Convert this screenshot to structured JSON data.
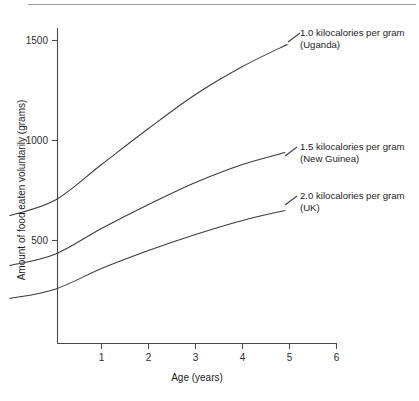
{
  "chart_data": {
    "type": "line",
    "title": "",
    "xlabel": "Age (years)",
    "ylabel": "Amount of food eaten voluntarily (grams)",
    "xlim": [
      -0.95,
      6.0
    ],
    "ylim": [
      0,
      1680
    ],
    "xticks": [
      1,
      2,
      3,
      4,
      5,
      6
    ],
    "xtick_labels": [
      "1",
      "2",
      "3",
      "4",
      "5",
      "6"
    ],
    "yticks": [
      500,
      1000,
      1500
    ],
    "ytick_labels": [
      "500",
      "1000",
      "1500"
    ],
    "grid": false,
    "legend_position": "inline-right-annotations",
    "series": [
      {
        "name": "1.0 kilocalories per gram (Uganda)",
        "label_line1": "1.0 kilocalories per gram",
        "label_line2": "(Uganda)",
        "x": [
          -0.95,
          0.0,
          1.0,
          2.0,
          3.0,
          4.0,
          4.95
        ],
        "values": [
          625,
          700,
          880,
          1060,
          1230,
          1370,
          1480
        ]
      },
      {
        "name": "1.5 kilocalories per gram (New Guinea)",
        "label_line1": "1.5 kilocalories per gram",
        "label_line2": "(New Guinea)",
        "x": [
          -0.95,
          0.0,
          1.0,
          2.0,
          3.0,
          4.0,
          4.9
        ],
        "values": [
          375,
          430,
          560,
          680,
          790,
          880,
          940
        ]
      },
      {
        "name": "2.0 kilocalories per gram (UK)",
        "label_line1": "2.0 kilocalories per gram",
        "label_line2": "(UK)",
        "x": [
          -0.95,
          0.0,
          1.0,
          2.0,
          3.0,
          4.0,
          4.9
        ],
        "values": [
          210,
          255,
          360,
          450,
          530,
          600,
          650
        ]
      }
    ]
  },
  "colors": {
    "line": "#3a3a3a",
    "axis": "#4a4a4a",
    "text": "#1d1d1d",
    "rule": "#9a9a9a",
    "background": "#ffffff"
  }
}
